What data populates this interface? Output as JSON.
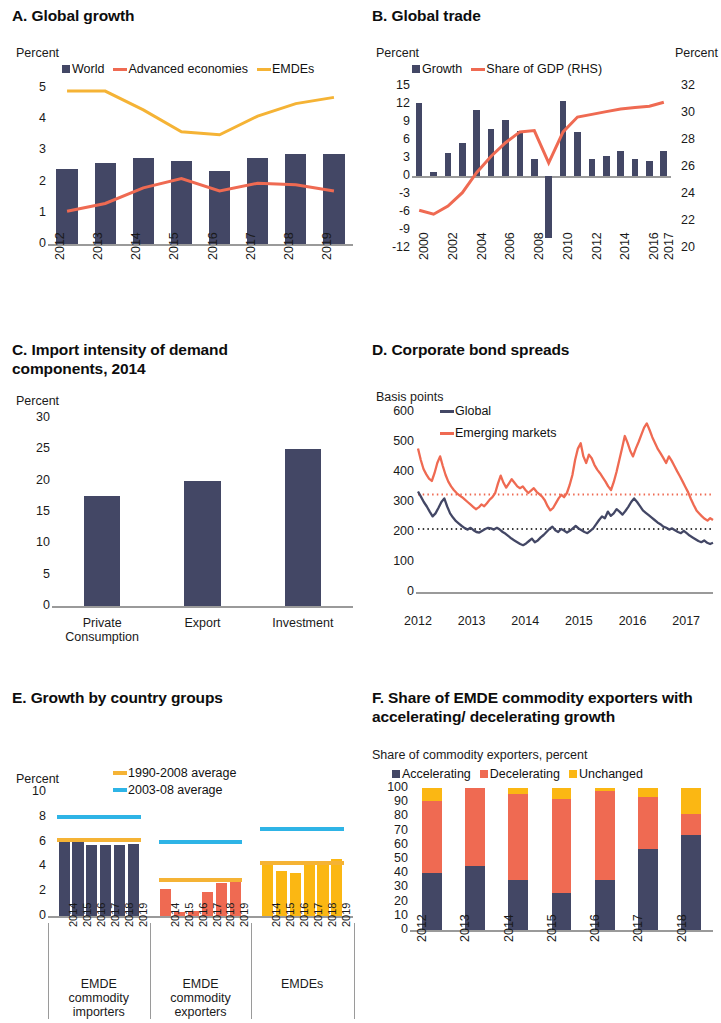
{
  "colors": {
    "navy": "#434765",
    "red": "#ef6a52",
    "yellow": "#f5b335",
    "gold": "#fbb713",
    "cyan": "#2eb4e6",
    "axis": "#9a9a9a",
    "text": "#1a1a1a"
  },
  "panelA": {
    "title": "A. Global growth",
    "ylabel": "Percent",
    "legend": [
      {
        "name": "World",
        "type": "square",
        "color": "#434765"
      },
      {
        "name": "Advanced economies",
        "type": "line",
        "color": "#ef6a52"
      },
      {
        "name": "EMDEs",
        "type": "line",
        "color": "#f5b335"
      }
    ],
    "chart_data": {
      "type": "bar",
      "title": "A. Global growth",
      "xlabel": "",
      "ylabel": "Percent",
      "ylim": [
        0,
        5
      ],
      "yticks": [
        0,
        1,
        2,
        3,
        4,
        5
      ],
      "grid": false,
      "legend_position": "top",
      "categories": [
        "2012",
        "2013",
        "2014",
        "2015",
        "2016",
        "2017",
        "2018",
        "2019"
      ],
      "series": [
        {
          "name": "World",
          "kind": "bar",
          "color": "#434765",
          "values": [
            2.4,
            2.6,
            2.75,
            2.65,
            2.35,
            2.75,
            2.9,
            2.9
          ]
        },
        {
          "name": "Advanced economies",
          "kind": "line",
          "color": "#ef6a52",
          "values": [
            1.05,
            1.3,
            1.8,
            2.1,
            1.7,
            1.95,
            1.9,
            1.7
          ]
        },
        {
          "name": "EMDEs",
          "kind": "line",
          "color": "#f5b335",
          "values": [
            4.9,
            4.9,
            4.3,
            3.6,
            3.5,
            4.1,
            4.5,
            4.7
          ]
        }
      ]
    }
  },
  "panelB": {
    "title": "B. Global trade",
    "ylabel_left": "Percent",
    "ylabel_right": "Percent",
    "legend": [
      {
        "name": "Growth",
        "type": "square",
        "color": "#434765"
      },
      {
        "name": "Share of GDP (RHS)",
        "type": "line",
        "color": "#ef6a52"
      }
    ],
    "chart_data": {
      "type": "bar",
      "title": "B. Global trade",
      "xlabel": "",
      "ylabel": "Percent",
      "ylabel_right": "Percent",
      "ylim": [
        -12,
        15
      ],
      "yticks": [
        -12,
        -9,
        -6,
        -3,
        0,
        3,
        6,
        9,
        12,
        15
      ],
      "ylim_right": [
        20,
        32
      ],
      "yticks_right": [
        20,
        22,
        24,
        26,
        28,
        30,
        32
      ],
      "grid": false,
      "legend_position": "top",
      "categories": [
        "2000",
        "2001",
        "2002",
        "2003",
        "2004",
        "2005",
        "2006",
        "2007",
        "2008",
        "2009",
        "2010",
        "2011",
        "2012",
        "2013",
        "2014",
        "2015",
        "2016",
        "2017"
      ],
      "xtick_labels": [
        "2000",
        "",
        "2002",
        "",
        "2004",
        "",
        "2006",
        "",
        "2008",
        "",
        "2010",
        "",
        "2012",
        "",
        "2014",
        "",
        "2016",
        "2017"
      ],
      "series": [
        {
          "name": "Growth",
          "kind": "bar",
          "color": "#434765",
          "values": [
            12.1,
            0.6,
            3.8,
            5.5,
            11.0,
            7.8,
            9.4,
            7.5,
            2.9,
            -10.3,
            12.5,
            7.4,
            2.9,
            3.3,
            4.2,
            2.8,
            2.5,
            4.1
          ]
        },
        {
          "name": "Share of GDP (RHS)",
          "kind": "line",
          "color": "#ef6a52",
          "axis": "right",
          "values": [
            22.8,
            22.5,
            23.1,
            24.1,
            25.6,
            26.8,
            27.8,
            28.6,
            28.7,
            26.3,
            28.6,
            29.7,
            29.9,
            30.1,
            30.3,
            30.4,
            30.5,
            30.8
          ]
        }
      ]
    }
  },
  "panelC": {
    "title": "C. Import intensity of demand components, 2014",
    "ylabel": "Percent",
    "chart_data": {
      "type": "bar",
      "title": "C. Import intensity of demand components, 2014",
      "xlabel": "",
      "ylabel": "Percent",
      "ylim": [
        0,
        30
      ],
      "yticks": [
        0,
        5,
        10,
        15,
        20,
        25,
        30
      ],
      "grid": false,
      "categories": [
        "Private Consumption",
        "Export",
        "Investment"
      ],
      "values": [
        17.6,
        20.0,
        25.0
      ],
      "color": "#434765"
    }
  },
  "panelD": {
    "title": "D. Corporate bond spreads",
    "ylabel": "Basis points",
    "legend": [
      {
        "name": "Global",
        "type": "line",
        "color": "#434765"
      },
      {
        "name": "Emerging markets",
        "type": "line",
        "color": "#ef6a52"
      }
    ],
    "chart_data": {
      "type": "line",
      "title": "D. Corporate bond spreads",
      "xlabel": "",
      "ylabel": "Basis points",
      "ylim": [
        0,
        600
      ],
      "yticks": [
        0,
        100,
        200,
        300,
        400,
        500,
        600
      ],
      "xlim": [
        2012,
        2017.5
      ],
      "xticks": [
        2012,
        2013,
        2014,
        2015,
        2016,
        2017
      ],
      "grid": false,
      "legend_position": "top-left",
      "reference_lines": [
        {
          "name": "Emerging markets average",
          "value": 325,
          "color": "#ef6a52",
          "style": "dotted"
        },
        {
          "name": "Global average",
          "value": 210,
          "color": "#3a3a3a",
          "style": "dotted"
        }
      ],
      "series": [
        {
          "name": "Global",
          "color": "#434765",
          "values": [
            335,
            318,
            300,
            285,
            268,
            252,
            262,
            280,
            300,
            312,
            285,
            262,
            248,
            236,
            228,
            220,
            213,
            208,
            214,
            206,
            200,
            198,
            204,
            210,
            214,
            212,
            208,
            214,
            208,
            200,
            194,
            186,
            178,
            172,
            166,
            160,
            156,
            162,
            170,
            178,
            166,
            172,
            182,
            190,
            200,
            210,
            218,
            206,
            200,
            210,
            205,
            198,
            204,
            212,
            220,
            212,
            206,
            200,
            196,
            204,
            212,
            226,
            240,
            252,
            246,
            268,
            254,
            262,
            276,
            268,
            258,
            270,
            284,
            300,
            312,
            300,
            286,
            272,
            264,
            256,
            248,
            240,
            232,
            226,
            218,
            214,
            208,
            212,
            206,
            200,
            196,
            204,
            196,
            188,
            182,
            176,
            170,
            166,
            172,
            164,
            160,
            164
          ]
        },
        {
          "name": "Emerging markets",
          "color": "#ef6a52",
          "values": [
            478,
            440,
            410,
            392,
            378,
            370,
            396,
            430,
            452,
            420,
            390,
            368,
            352,
            340,
            330,
            322,
            316,
            308,
            300,
            292,
            284,
            276,
            282,
            292,
            286,
            296,
            308,
            316,
            330,
            362,
            388,
            364,
            348,
            362,
            376,
            364,
            352,
            346,
            352,
            340,
            330,
            338,
            346,
            334,
            326,
            318,
            306,
            286,
            272,
            280,
            296,
            312,
            324,
            316,
            330,
            356,
            390,
            440,
            478,
            496,
            452,
            430,
            458,
            446,
            424,
            408,
            396,
            382,
            368,
            352,
            340,
            366,
            400,
            440,
            478,
            520,
            498,
            470,
            452,
            478,
            500,
            524,
            548,
            562,
            540,
            516,
            496,
            476,
            462,
            446,
            430,
            452,
            438,
            420,
            402,
            386,
            368,
            350,
            332,
            310,
            290,
            272,
            262,
            252,
            244,
            238,
            246,
            240
          ]
        }
      ]
    }
  },
  "panelE": {
    "title": "E. Growth by country groups",
    "ylabel": "Percent",
    "legend": [
      {
        "name": "1990-2008 average",
        "type": "line",
        "color": "#f5b335"
      },
      {
        "name": "2003-08 average",
        "type": "line",
        "color": "#2eb4e6"
      }
    ],
    "chart_data": {
      "type": "bar",
      "title": "E. Growth by country groups",
      "xlabel": "",
      "ylabel": "Percent",
      "ylim": [
        0,
        10
      ],
      "yticks": [
        0,
        2,
        4,
        6,
        8,
        10
      ],
      "grid": false,
      "groups": [
        {
          "label": "EMDE commodity importers",
          "color": "#434765",
          "categories": [
            "2014",
            "2015",
            "2016",
            "2017",
            "2018",
            "2019"
          ],
          "values": [
            6.0,
            6.0,
            5.75,
            5.75,
            5.75,
            5.8
          ],
          "avg_1990_2008": 6.1,
          "avg_2003_08": 8.0
        },
        {
          "label": "EMDE commodity exporters",
          "color": "#ef6a52",
          "categories": [
            "2014",
            "2015",
            "2016",
            "2017",
            "2018",
            "2019"
          ],
          "values": [
            2.2,
            0.3,
            0.4,
            1.9,
            2.7,
            3.0
          ],
          "avg_1990_2008": 2.9,
          "avg_2003_08": 6.0
        },
        {
          "label": "EMDEs",
          "color": "#fbb713",
          "categories": [
            "2014",
            "2015",
            "2016",
            "2017",
            "2018",
            "2019"
          ],
          "values": [
            4.3,
            3.6,
            3.5,
            4.2,
            4.4,
            4.6
          ],
          "avg_1990_2008": 4.3,
          "avg_2003_08": 7.0
        }
      ]
    }
  },
  "panelF": {
    "title": "F. Share of EMDE commodity exporters with accelerating/ decelerating growth",
    "ylabel": "Share of commodity exporters, percent",
    "legend": [
      {
        "name": "Accelerating",
        "type": "square",
        "color": "#434765"
      },
      {
        "name": "Decelerating",
        "type": "square",
        "color": "#ef6a52"
      },
      {
        "name": "Unchanged",
        "type": "square",
        "color": "#fbb713"
      }
    ],
    "chart_data": {
      "type": "bar",
      "subtype": "stacked",
      "title": "F. Share of EMDE commodity exporters with accelerating/decelerating growth",
      "xlabel": "",
      "ylabel": "Share of commodity exporters, percent",
      "ylim": [
        0,
        100
      ],
      "yticks": [
        0,
        10,
        20,
        30,
        40,
        50,
        60,
        70,
        80,
        90,
        100
      ],
      "grid": false,
      "legend_position": "top",
      "categories": [
        "2012",
        "2013",
        "2014",
        "2015",
        "2016",
        "2017",
        "2018"
      ],
      "series": [
        {
          "name": "Accelerating",
          "color": "#434765",
          "values": [
            40,
            45,
            35,
            26,
            35,
            57,
            67
          ]
        },
        {
          "name": "Decelerating",
          "color": "#ef6a52",
          "values": [
            51,
            55,
            61,
            66,
            63,
            37,
            15
          ]
        },
        {
          "name": "Unchanged",
          "color": "#fbb713",
          "values": [
            9,
            0,
            4,
            8,
            2,
            6,
            18
          ]
        }
      ]
    }
  }
}
